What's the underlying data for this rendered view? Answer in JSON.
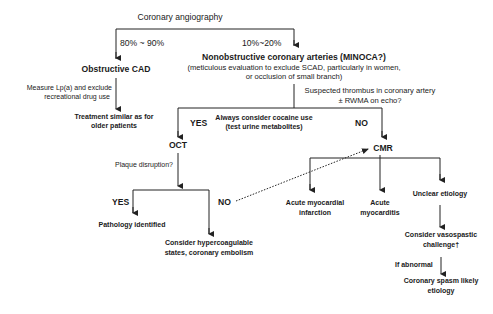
{
  "diagram": {
    "type": "flowchart",
    "root": "Coronary angiography",
    "branch_left_pct": "80% ~ 90%",
    "branch_right_pct": "10%~20%",
    "obstructive": {
      "title": "Obstructive CAD",
      "step_label_1": "Measure Lp(a) and exclude",
      "step_label_2": "recreational drug use",
      "result_1": "Treatment similar as for",
      "result_2": "older patients"
    },
    "nonobstructive": {
      "title": "Nonobstructive coronary arteries (MINOCA?)",
      "sub_1": "(meticulous evaluation to exclude SCAD, particularly in women,",
      "sub_2": "or occlusion of small branch)",
      "question_1": "Suspected thrombus in coronary artery",
      "question_2": "± RWMA on echo?",
      "yes": "YES",
      "no": "NO",
      "note_1": "Always consider cocaine use",
      "note_2": "(test urine metabolites)"
    },
    "oct": {
      "title": "OCT",
      "question": "Plaque disruption?",
      "yes": "YES",
      "no": "NO",
      "yes_result": "Pathology identified",
      "no_result_1": "Consider hypercoagulable",
      "no_result_2": "states, coronary embolism"
    },
    "cmr": {
      "title": "CMR",
      "outcome_1a": "Acute myocardial",
      "outcome_1b": "infarction",
      "outcome_2a": "Acute",
      "outcome_2b": "myocarditis",
      "outcome_3": "Unclear etiology",
      "next_1": "Consider vasospastic",
      "next_2": "challenge†",
      "condition": "If abnormal",
      "final_1": "Coronary spasm likely",
      "final_2": "etiology"
    }
  },
  "colors": {
    "line": "#222222",
    "text": "#1a1a1a",
    "background": "#ffffff"
  }
}
